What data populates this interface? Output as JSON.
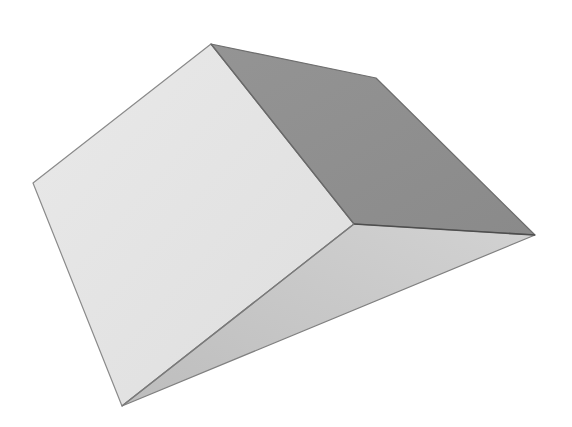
{
  "figure": {
    "width": 572,
    "height": 427,
    "background": "#ffffff"
  },
  "shape": {
    "type": "wedge",
    "vertices": {
      "top": [
        211,
        44
      ],
      "back_right": [
        376,
        78
      ],
      "right": [
        535,
        235
      ],
      "middle": [
        354,
        224
      ],
      "left": [
        33,
        183
      ],
      "bottom": [
        122,
        406
      ]
    },
    "faces": [
      {
        "name": "front-face",
        "points": "33,183 211,44 354,224 122,406",
        "fill": "#e4e4e4",
        "stroke": "#8a8a8a"
      },
      {
        "name": "top-right-face",
        "points": "211,44 376,78 535,235 354,224",
        "fill": "#8f8f8f",
        "stroke": "#6e6e6e"
      },
      {
        "name": "bottom-slope-face",
        "points": "122,406 354,224 535,235",
        "fill": "#c6c6c6",
        "stroke": "#808080"
      }
    ],
    "edge_color": "#6a6a6a"
  }
}
